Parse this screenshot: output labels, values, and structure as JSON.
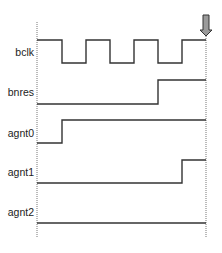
{
  "diagram": {
    "type": "timing-diagram",
    "signals": [
      {
        "name": "bclk",
        "label_y": 52,
        "high_y": 40,
        "low_y": 63,
        "points": [
          [
            37,
            40
          ],
          [
            62,
            40
          ],
          [
            62,
            63
          ],
          [
            86,
            63
          ],
          [
            86,
            40
          ],
          [
            110,
            40
          ],
          [
            110,
            63
          ],
          [
            134,
            63
          ],
          [
            134,
            40
          ],
          [
            158,
            40
          ],
          [
            158,
            63
          ],
          [
            182,
            63
          ],
          [
            182,
            40
          ],
          [
            206,
            40
          ]
        ]
      },
      {
        "name": "bnres",
        "label_y": 92,
        "high_y": 80,
        "low_y": 104,
        "points": [
          [
            37,
            104
          ],
          [
            158,
            104
          ],
          [
            158,
            80
          ],
          [
            206,
            80
          ]
        ]
      },
      {
        "name": "agnt0",
        "label_y": 133,
        "high_y": 120,
        "low_y": 143,
        "points": [
          [
            37,
            143
          ],
          [
            62,
            143
          ],
          [
            62,
            120
          ],
          [
            206,
            120
          ]
        ]
      },
      {
        "name": "agnt1",
        "label_y": 172,
        "high_y": 160,
        "low_y": 183,
        "points": [
          [
            37,
            183
          ],
          [
            182,
            183
          ],
          [
            182,
            160
          ],
          [
            206,
            160
          ]
        ]
      },
      {
        "name": "agnt2",
        "label_y": 212,
        "high_y": 200,
        "low_y": 223,
        "points": [
          [
            37,
            223
          ],
          [
            206,
            223
          ]
        ]
      }
    ],
    "time_markers": {
      "start_x": 37,
      "end_x": 206,
      "top_y": 22,
      "bottom_y": 238
    },
    "marker_arrow": {
      "x": 206,
      "top_y": 15,
      "tip_y": 36,
      "fill": "#9a9a9a",
      "stroke": "#333333"
    },
    "colors": {
      "signal": "#333333",
      "dotted": "#777777"
    }
  }
}
